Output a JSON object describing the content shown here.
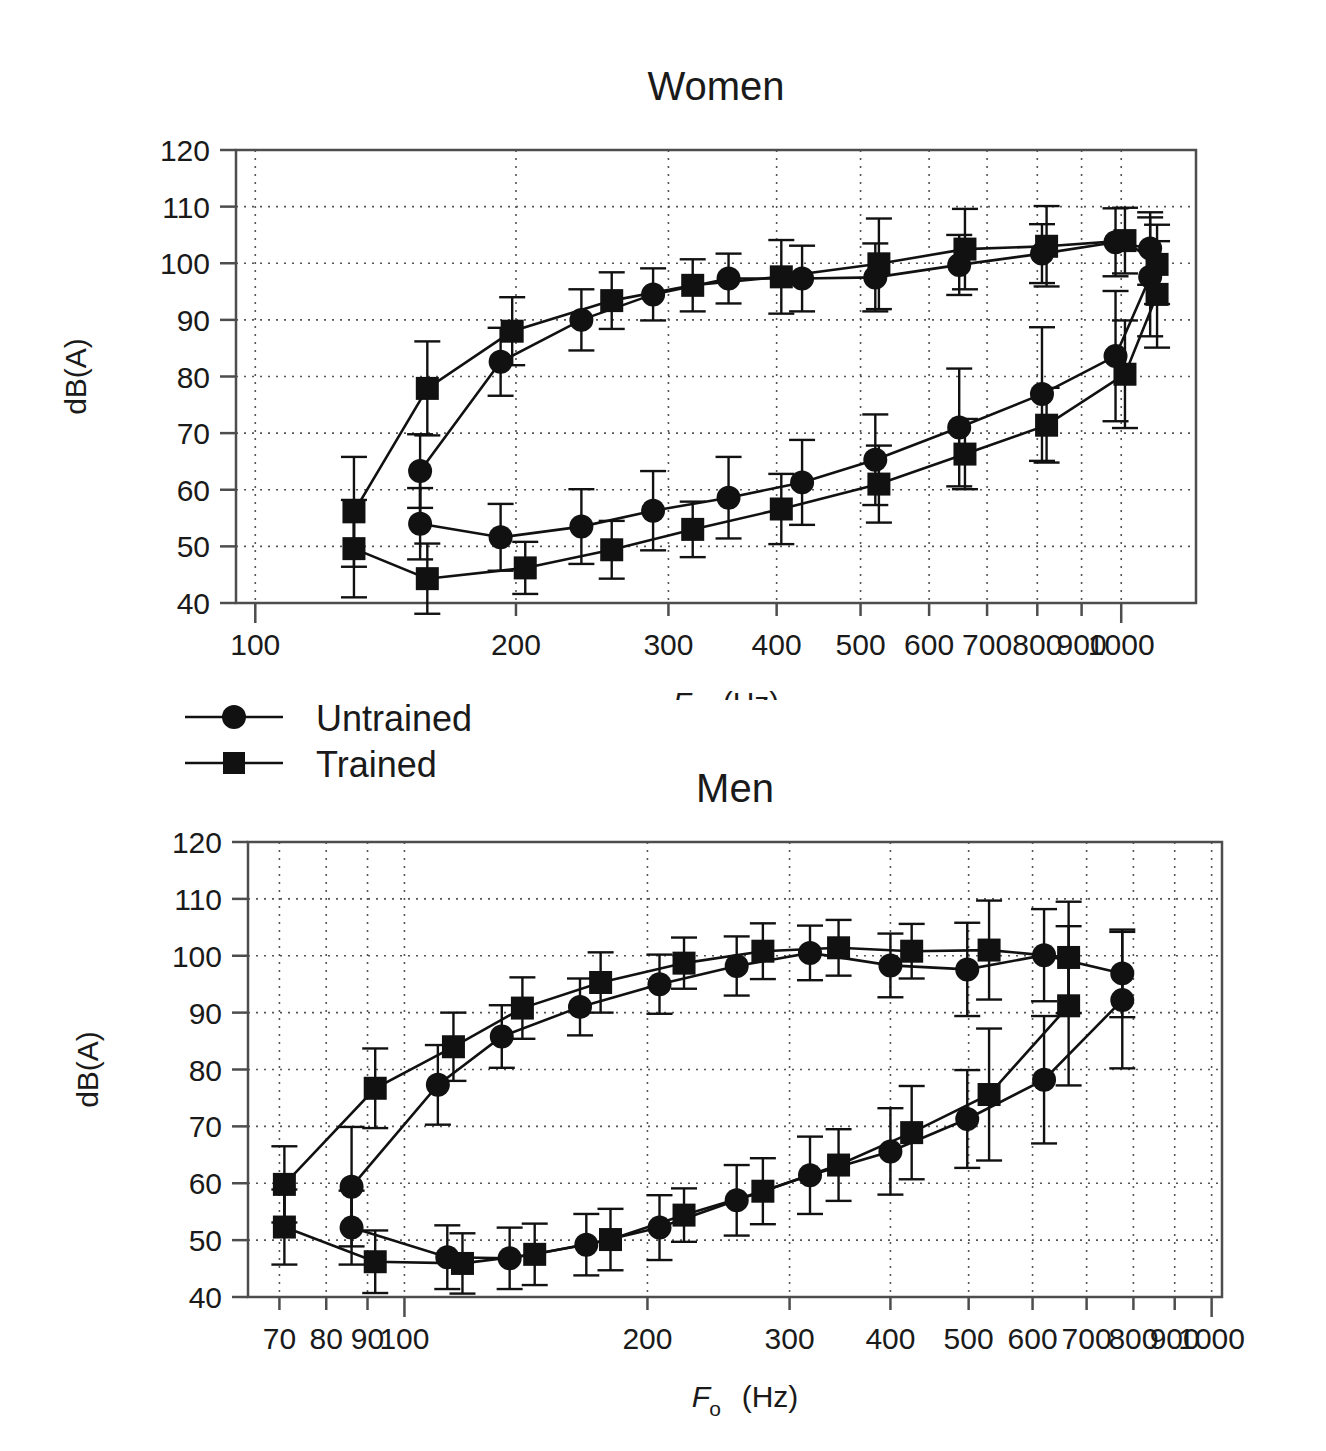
{
  "figure": {
    "background": "#ffffff",
    "ink_color": "#1a1a1a"
  },
  "legend": {
    "name": "series-legend",
    "items": [
      {
        "label": "Untrained",
        "marker": "circle",
        "color": "#111111"
      },
      {
        "label": "Trained",
        "marker": "square",
        "color": "#111111"
      }
    ]
  },
  "chart_data": [
    {
      "id": "women",
      "type": "line",
      "title": "Women",
      "xlabel": "F₀ (Hz)",
      "xlabel_main": "F",
      "xlabel_sub": "o",
      "xlabel_unit": "(Hz)",
      "ylabel": "dB(A)",
      "xscale": "log",
      "xlim": [
        95,
        1220
      ],
      "ylim": [
        40,
        120
      ],
      "yticks": [
        40,
        50,
        60,
        70,
        80,
        90,
        100,
        110,
        120
      ],
      "xticks": [
        100,
        200,
        300,
        400,
        500,
        600,
        700,
        800,
        900,
        1000
      ],
      "xtick_labels": [
        "100",
        "200",
        "300",
        "400",
        "500",
        "600",
        "700",
        "800",
        "900",
        "1000"
      ],
      "grid": true,
      "grid_axes": "both",
      "legend_position": "below-outside",
      "series": [
        {
          "name": "Untrained",
          "marker": "circle",
          "branch_upper": {
            "x": [
              155,
              192,
              238,
              288,
              352,
              428,
              520,
              650,
              810,
              985,
              1080
            ],
            "y": [
              63.3,
              82.6,
              90.0,
              94.5,
              97.3,
              97.3,
              97.5,
              99.7,
              101.7,
              103.7,
              102.6
            ],
            "err": [
              6.5,
              6.0,
              5.4,
              4.6,
              4.4,
              5.8,
              6.0,
              5.3,
              5.2,
              6.0,
              6.4
            ]
          },
          "branch_lower": {
            "x": [
              155,
              192,
              238,
              288,
              352,
              428,
              520,
              650,
              810,
              985,
              1080
            ],
            "y": [
              54.0,
              51.6,
              53.5,
              56.3,
              58.6,
              61.3,
              65.3,
              71.0,
              76.9,
              83.6,
              97.6
            ],
            "err": [
              6.3,
              5.9,
              6.6,
              7.0,
              7.2,
              7.5,
              8.0,
              10.4,
              11.8,
              11.5,
              10.5
            ]
          }
        },
        {
          "name": "Trained",
          "marker": "square",
          "branch_upper": {
            "x": [
              130,
              158,
              198,
              258,
              320,
              405,
              525,
              660,
              820,
              1010,
              1100
            ],
            "y": [
              56.1,
              77.9,
              88.0,
              93.4,
              96.1,
              97.6,
              99.9,
              102.5,
              103.0,
              104.0,
              99.8
            ],
            "err": [
              9.7,
              8.3,
              6.0,
              5.0,
              4.6,
              6.5,
              8.0,
              7.1,
              7.1,
              5.8,
              7.0
            ]
          },
          "branch_lower": {
            "x": [
              130,
              158,
              205,
              258,
              320,
              405,
              525,
              660,
              820,
              1010,
              1100
            ],
            "y": [
              49.6,
              44.3,
              46.2,
              49.4,
              53.0,
              56.6,
              61.0,
              66.3,
              71.4,
              80.4,
              94.5
            ],
            "err": [
              8.6,
              6.2,
              4.6,
              5.1,
              4.9,
              6.2,
              6.8,
              6.2,
              6.6,
              9.5,
              9.4
            ]
          }
        }
      ]
    },
    {
      "id": "men",
      "type": "line",
      "title": "Men",
      "xlabel": "F₀ (Hz)",
      "xlabel_main": "F",
      "xlabel_sub": "o",
      "xlabel_unit": "(Hz)",
      "ylabel": "dB(A)",
      "xscale": "log",
      "xlim": [
        64,
        1030
      ],
      "ylim": [
        40,
        120
      ],
      "yticks": [
        40,
        50,
        60,
        70,
        80,
        90,
        100,
        110,
        120
      ],
      "xticks": [
        70,
        80,
        90,
        100,
        200,
        300,
        400,
        500,
        600,
        700,
        800,
        900,
        1000
      ],
      "xtick_labels": [
        "70",
        "80",
        "90",
        "100",
        "200",
        "300",
        "400",
        "500",
        "600",
        "700",
        "800",
        "900",
        "1000"
      ],
      "grid": true,
      "grid_axes": "both",
      "legend_position": "above-outside",
      "series": [
        {
          "name": "Untrained",
          "marker": "circle",
          "branch_upper": {
            "x": [
              86,
              110,
              132,
              165,
              207,
              258,
              318,
              400,
              498,
              620,
              775
            ],
            "y": [
              59.4,
              77.3,
              85.8,
              91.0,
              95.0,
              98.2,
              100.5,
              98.3,
              97.6,
              100.1,
              96.9
            ],
            "err": [
              10.5,
              7.0,
              5.5,
              5.0,
              5.2,
              5.2,
              4.8,
              5.6,
              8.2,
              8.1,
              7.7
            ]
          },
          "branch_lower": {
            "x": [
              86,
              113,
              135,
              168,
              207,
              258,
              318,
              400,
              498,
              620,
              775
            ],
            "y": [
              52.2,
              47.0,
              46.8,
              49.2,
              52.2,
              57.0,
              61.4,
              65.6,
              71.3,
              78.2,
              92.2
            ],
            "err": [
              6.5,
              5.6,
              5.4,
              5.4,
              5.7,
              6.2,
              6.8,
              7.6,
              8.6,
              11.2,
              12.0
            ]
          }
        },
        {
          "name": "Trained",
          "marker": "square",
          "branch_upper": {
            "x": [
              71,
              92,
              115,
              140,
              175,
              222,
              278,
              345,
              425,
              530,
              665
            ],
            "y": [
              59.8,
              76.7,
              84.0,
              90.8,
              95.3,
              98.7,
              100.8,
              101.4,
              100.8,
              101.0,
              99.7
            ],
            "err": [
              6.7,
              7.0,
              6.0,
              5.4,
              5.3,
              4.5,
              4.9,
              4.9,
              4.8,
              8.7,
              9.8
            ]
          },
          "branch_lower": {
            "x": [
              71,
              92,
              118,
              145,
              180,
              222,
              278,
              345,
              425,
              530,
              665
            ],
            "y": [
              52.3,
              46.2,
              45.9,
              47.5,
              50.1,
              54.4,
              58.6,
              63.2,
              68.9,
              75.6,
              91.2
            ],
            "err": [
              6.6,
              5.5,
              5.3,
              5.4,
              5.4,
              4.7,
              5.8,
              6.3,
              8.2,
              11.6,
              14.0
            ]
          }
        }
      ]
    }
  ]
}
